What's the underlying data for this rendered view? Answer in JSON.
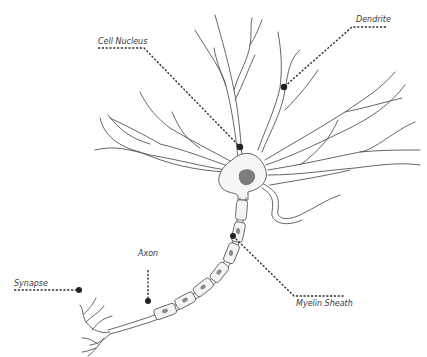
{
  "diagram": {
    "colors": {
      "background": "#ffffff",
      "outline": "#555555",
      "nucleus": "#7d7d7d",
      "leader_lines": "#333333",
      "label_text": "#3a3a3a"
    },
    "labels": {
      "cell_nucleus": "Cell Nucleus",
      "dendrite": "Dendrite",
      "axon": "Axon",
      "synapse": "Synapse",
      "myelin_sheath": "Myelin Sheath"
    }
  }
}
